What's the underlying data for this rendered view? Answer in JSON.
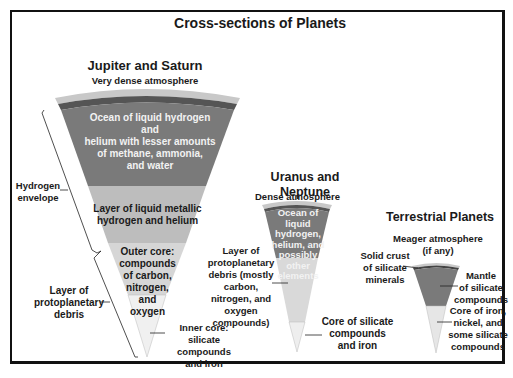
{
  "title": "Cross-sections of Planets",
  "colors": {
    "atmosphere": "#c8c8c8",
    "crust": "#5a5a5a",
    "ocean": "#7a7a7a",
    "metallic": "#bdbdbd",
    "outer_core": "#d6d6d6",
    "inner_core": "#efefef",
    "frame": "#111111"
  },
  "jupiter_saturn": {
    "heading": "Jupiter and Saturn",
    "atmosphere": "Very dense atmosphere",
    "ocean": "Ocean of liquid hydrogen and\nhelium with lesser amounts\nof methane, ammonia,\nand water",
    "metallic": "Layer of liquid metallic\nhydrogen and helium",
    "outer_core": "Outer core:\ncompounds\nof carbon,\nnitrogen,\nand\noxygen",
    "inner_core": "Inner core:\nsilicate compounds\nand iron",
    "hydrogen_envelope": "Hydrogen\nenvelope",
    "protoplanetary": "Layer of\nprotoplanetary\ndebris"
  },
  "uranus_neptune": {
    "heading": "Uranus and Neptune",
    "atmosphere": "Dense atmosphere",
    "ocean": "Ocean of\nliquid hydrogen,\nhelium, and\npossibly other\nelements",
    "protoplanetary": "Layer of\nprotoplanetary\ndebris (mostly carbon,\nnitrogen, and oxygen\ncompounds)",
    "core": "Core of silicate\ncompounds\nand iron"
  },
  "terrestrial": {
    "heading": "Terrestrial Planets",
    "atmosphere": "Meager atmosphere\n(if any)",
    "crust": "Solid crust\nof silicate\nminerals",
    "mantle": "Mantle\nof silicate\ncompounds",
    "core": "Core of iron,\nnickel, and\nsome silicate\ncompounds"
  }
}
